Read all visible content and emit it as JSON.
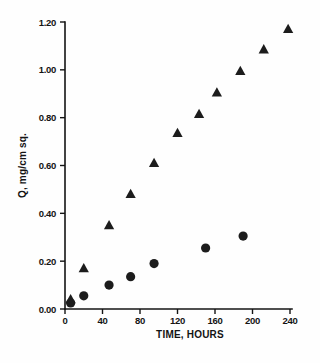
{
  "chart_data": {
    "type": "scatter",
    "title": "",
    "xlabel": "TIME,  HOURS",
    "ylabel": "Q,  mg/cm sq.",
    "xlim": [
      0,
      240
    ],
    "ylim": [
      0.0,
      1.2
    ],
    "xticks": [
      0,
      40,
      80,
      120,
      160,
      200,
      240
    ],
    "xtick_labels": [
      "0",
      "40",
      "80",
      "120",
      "160",
      "200",
      "240"
    ],
    "yticks": [
      0.0,
      0.2,
      0.4,
      0.6,
      0.8,
      1.0,
      1.2
    ],
    "ytick_labels": [
      "0.00",
      "0.20",
      "0.40",
      "0.60",
      "0.80",
      "1.00",
      "1.20"
    ],
    "grid": false,
    "legend": "none",
    "marker_color": "#1c1c1c",
    "series": [
      {
        "name": "triangles",
        "marker": "triangle",
        "x": [
          6,
          20,
          47,
          70,
          95,
          120,
          143,
          162,
          187,
          212,
          238
        ],
        "y": [
          0.04,
          0.17,
          0.35,
          0.48,
          0.61,
          0.735,
          0.815,
          0.905,
          0.995,
          1.085,
          1.17
        ]
      },
      {
        "name": "circles",
        "marker": "circle",
        "x": [
          6,
          20,
          47,
          70,
          95,
          150,
          190
        ],
        "y": [
          0.025,
          0.055,
          0.1,
          0.135,
          0.19,
          0.255,
          0.305
        ]
      }
    ]
  },
  "figure": {
    "xlabel": "TIME,  HOURS",
    "ylabel": "Q,  mg/cm sq."
  }
}
